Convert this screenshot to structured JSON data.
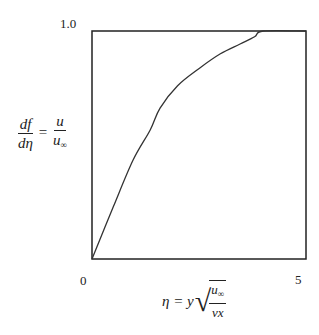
{
  "chart_data": {
    "type": "line",
    "title": "",
    "xlabel": "η = y √(u∞ / νx)",
    "ylabel": "df/dη = u/u∞",
    "xlim": [
      0,
      5
    ],
    "ylim": [
      0,
      1.0
    ],
    "x_ticks": [
      "0",
      "5"
    ],
    "y_ticks": [
      "1.0"
    ],
    "grid": false,
    "legend": null,
    "series": [
      {
        "name": "df/dη",
        "x": [
          0,
          0.5,
          0.96,
          1.36,
          1.59,
          2.0,
          2.52,
          3.0,
          3.46,
          3.8,
          4.0,
          5.0
        ],
        "y": [
          0,
          0.23,
          0.434,
          0.566,
          0.662,
          0.76,
          0.838,
          0.9,
          0.943,
          0.975,
          1.0,
          1.0
        ]
      }
    ]
  },
  "labels": {
    "y_top": "1.0",
    "x_left": "0",
    "x_right": "5",
    "ylabel_num_left": "df",
    "ylabel_den_left": "dη",
    "ylabel_eq": "=",
    "ylabel_num_right": "u",
    "ylabel_den_right": "u",
    "ylabel_den_right_sub": "∞",
    "xlabel_lhs": "η = y",
    "xlabel_num": "u",
    "xlabel_num_sub": "∞",
    "xlabel_den": "νx"
  }
}
